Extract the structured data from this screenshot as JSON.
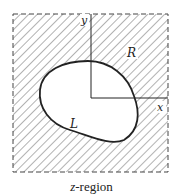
{
  "figure": {
    "caption_var": "z",
    "caption_rest": "-region",
    "labels": {
      "y_axis": "y",
      "x_axis": "x",
      "region_outside": "R",
      "curve": "L"
    },
    "colors": {
      "stroke": "#222222",
      "hatch": "#555555",
      "background": "#ffffff"
    }
  }
}
